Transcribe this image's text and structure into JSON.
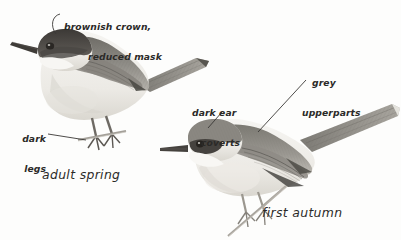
{
  "plate": {
    "kind": "field-guide-illustration",
    "subject": "warbler-plumage-comparison",
    "background_color": "#fdfdfc",
    "ink_color": "#2b2a28",
    "width": 401,
    "height": 240
  },
  "annotations": {
    "crown": {
      "line1": "brownish crown,",
      "line2": "reduced mask"
    },
    "legs": {
      "line1": "dark",
      "line2": "legs"
    },
    "ear_coverts": {
      "line1": "dark ear",
      "line2": "coverts"
    },
    "upperparts": {
      "line1": "grey",
      "line2": "upperparts"
    }
  },
  "captions": {
    "left_bird": "adult spring",
    "right_bird": "first autumn"
  },
  "birds": [
    {
      "name": "adult-spring-warbler",
      "facing": "left",
      "plumage": {
        "crown": "brownish-dark cap",
        "mask": "reduced dark mask",
        "throat": "white",
        "upperparts": "grey-brown",
        "underparts": "off-white",
        "legs": "dark"
      }
    },
    {
      "name": "first-autumn-warbler",
      "facing": "left",
      "plumage": {
        "crown": "pale grey",
        "ear_coverts": "dark",
        "throat": "white",
        "upperparts": "grey",
        "underparts": "buff-white",
        "legs": "pale"
      }
    }
  ],
  "palette": {
    "upperpart_grey": "#8d8b85",
    "upperpart_dark": "#5d5b56",
    "cap_dark": "#46433f",
    "underpart_pale": "#f2f0ec",
    "shadow": "#b8b5ae",
    "leg": "#6e6a64"
  }
}
